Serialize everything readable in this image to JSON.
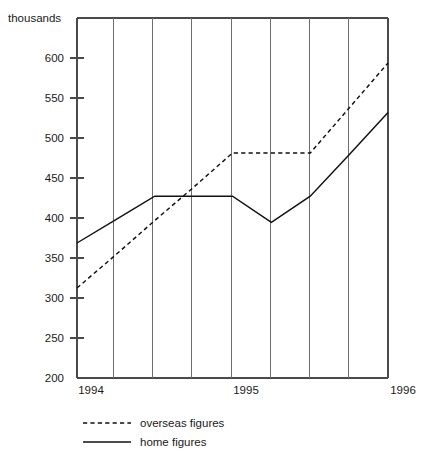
{
  "chart_data": {
    "type": "line",
    "title": "",
    "subtitle": "",
    "xlabel": "",
    "ylabel": "thousands",
    "ylim": [
      200,
      600
    ],
    "xlim": [
      0,
      8
    ],
    "grid": "vertical",
    "legend_position": "bottom-left",
    "y_ticks": [
      200,
      250,
      300,
      350,
      400,
      450,
      500,
      550,
      600
    ],
    "y_tick_labels": [
      "200",
      "250",
      "300",
      "350",
      "400",
      "450",
      "500",
      "550",
      "600"
    ],
    "x_ticks": [
      0,
      4,
      8
    ],
    "x_tick_labels": [
      "1994",
      "1995",
      "1996"
    ],
    "x_gridline_count": 9,
    "x": [
      0,
      1,
      2,
      3,
      4,
      5,
      6,
      7,
      8
    ],
    "series": [
      {
        "name": "overseas figures",
        "style": "dashed",
        "color": "#111111",
        "values": [
          300,
          337,
          375,
          412,
          450,
          450,
          450,
          500,
          550
        ]
      },
      {
        "name": "home figures",
        "style": "solid",
        "color": "#111111",
        "values": [
          350,
          376,
          402,
          402,
          402,
          373,
          402,
          448,
          495
        ]
      }
    ],
    "legend": [
      {
        "label": "overseas figures",
        "style": "dashed"
      },
      {
        "label": "home figures",
        "style": "solid"
      }
    ]
  },
  "axis": {
    "y_title": "thousands",
    "y_tick_labels": [
      "600",
      "550",
      "500",
      "450",
      "400",
      "350",
      "300",
      "250",
      "200"
    ],
    "x_tick_labels": [
      "1994",
      "1995",
      "1996"
    ]
  },
  "legend": {
    "overseas_label": "overseas figures",
    "home_label": "home figures"
  },
  "colors": {
    "line": "#111111",
    "axis": "#4a4a4a",
    "grid": "#6e6e6e",
    "text": "#1a1a1a",
    "background": "#ffffff"
  }
}
